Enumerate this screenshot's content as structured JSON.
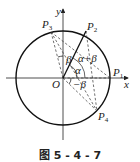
{
  "figure": {
    "caption": "图 5 - 4 - 7",
    "axes": {
      "x_label": "x",
      "y_label": "y",
      "origin_label": "O"
    },
    "points": [
      {
        "name": "P",
        "sub": "1"
      },
      {
        "name": "P",
        "sub": "2"
      },
      {
        "name": "P",
        "sub": "3"
      },
      {
        "name": "P",
        "sub": "4"
      }
    ],
    "angles": {
      "alpha": "α",
      "beta": "β",
      "alpha_plus_beta": "α+β",
      "neg_beta": "−β"
    }
  }
}
